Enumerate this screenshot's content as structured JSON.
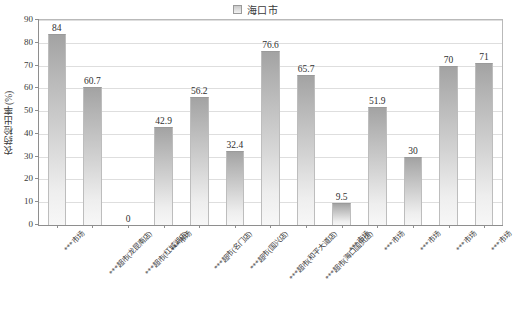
{
  "legend": {
    "label": "海口市",
    "marker_icon": "legend-square-icon",
    "color": "#c9c9c9"
  },
  "axes": {
    "y_title": "农药检出率(%)",
    "y_ticks": [
      "90",
      "80",
      "70",
      "60",
      "50",
      "40",
      "30",
      "20",
      "10",
      "0"
    ],
    "y_min": 0,
    "y_max": 90
  },
  "chart_data": {
    "type": "bar",
    "title": "",
    "subtitle": "",
    "xlabel": "",
    "ylabel": "农药检出率(%)",
    "ylim": [
      0,
      90
    ],
    "ytick_step": 10,
    "grid": true,
    "legend_position": "top-center",
    "series": [
      {
        "name": "海口市",
        "color": "#c9c9c9",
        "values": [
          84,
          60.7,
          0,
          42.9,
          56.2,
          32.4,
          76.6,
          65.7,
          9.5,
          51.9,
          30,
          70,
          71
        ]
      }
    ],
    "categories": [
      "***市场",
      "***超市(龙昆南店)",
      "***超市(红城湖店)",
      "***市场",
      "***超市(名门店)",
      "***超市(国兴店)",
      "***超市(和平大道店)",
      "***超市(海口国贸店)",
      "***市场",
      "***市场",
      "***市场",
      "***市场",
      "***市场"
    ],
    "data_labels": [
      "84",
      "60.7",
      "0",
      "42.9",
      "56.2",
      "32.4",
      "76.6",
      "65.7",
      "9.5",
      "51.9",
      "30",
      "70",
      "71"
    ]
  }
}
